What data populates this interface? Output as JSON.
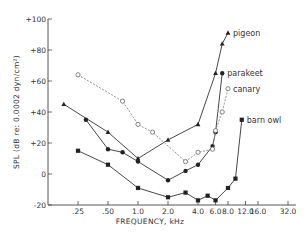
{
  "chart_data": {
    "type": "line",
    "title": "",
    "xlabel": "FREQUENCY, kHz",
    "ylabel": "SPL (dB re: 0.0002 dyn/cm²)",
    "xscale": "log2",
    "xlim": [
      0.125,
      32
    ],
    "ylim": [
      -20,
      100
    ],
    "x_ticks": [
      0.25,
      0.5,
      1.0,
      2.0,
      4.0,
      6.0,
      8.0,
      12.0,
      16.0,
      32.0
    ],
    "x_tick_labels": [
      ".25",
      ".50",
      "1.0",
      "2.0",
      "4.0",
      "6.0",
      "8.0",
      "12.0",
      "16.0",
      "32.0"
    ],
    "y_ticks": [
      -20,
      0,
      20,
      40,
      60,
      80,
      100
    ],
    "y_tick_labels": [
      "-20",
      "0",
      "+20",
      "+40",
      "+60",
      "+80",
      "+100"
    ],
    "grid": false,
    "legend_position": "inline labels at series ends",
    "series": [
      {
        "name": "pigeon",
        "marker": "filled-triangle",
        "line": "solid",
        "x": [
          0.18,
          0.5,
          1.0,
          2.0,
          4.0,
          6.0,
          7.0,
          8.0
        ],
        "y": [
          45,
          27,
          10,
          22,
          32,
          65,
          84,
          91
        ]
      },
      {
        "name": "parakeet",
        "marker": "filled-circle",
        "line": "solid",
        "x": [
          0.3,
          0.5,
          0.7,
          1.0,
          2.0,
          3.0,
          4.0,
          5.6,
          6.0,
          7.0
        ],
        "y": [
          35,
          16,
          14,
          8,
          -4,
          2,
          6,
          18,
          27,
          65
        ]
      },
      {
        "name": "canary",
        "marker": "open-circle",
        "line": "dashed",
        "x": [
          0.25,
          0.7,
          1.0,
          1.4,
          3.0,
          4.0,
          5.6,
          6.0,
          7.0,
          8.0
        ],
        "y": [
          64,
          47,
          32,
          27,
          8,
          14,
          16,
          28,
          40,
          55
        ]
      },
      {
        "name": "barn owl",
        "marker": "filled-square",
        "line": "solid",
        "x": [
          0.25,
          0.5,
          1.0,
          2.0,
          3.0,
          4.0,
          5.0,
          6.0,
          8.0,
          9.5,
          11.0
        ],
        "y": [
          15,
          6,
          -9,
          -15,
          -12,
          -17,
          -14,
          -17,
          -9,
          -3,
          35
        ]
      }
    ]
  }
}
